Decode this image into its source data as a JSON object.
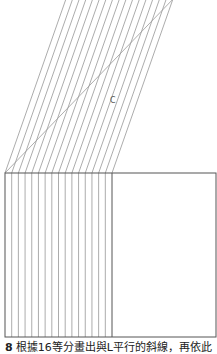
{
  "diagram": {
    "label": "C",
    "divisions": 16,
    "rect": {
      "x": 5,
      "y": 173,
      "width": 211,
      "height": 164
    },
    "divided_width": 107,
    "hypotenuse": {
      "x1": 5,
      "y1": 173,
      "x2": 176,
      "y2": -4
    },
    "line_color": "#888888",
    "border_color": "#555555"
  },
  "caption": {
    "number": "8",
    "text": "根據16等分畫出與L平行的斜線，再依此"
  }
}
